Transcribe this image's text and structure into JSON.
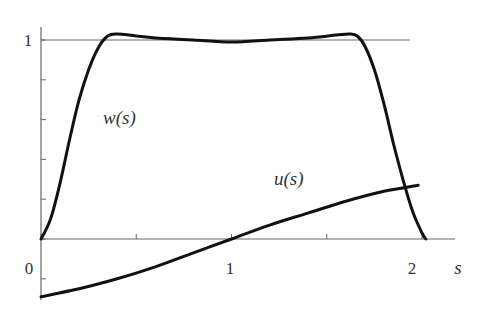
{
  "chart_data": {
    "type": "line",
    "title": "",
    "xlabel": "s",
    "ylabel": "",
    "xlim": [
      0,
      2.2
    ],
    "ylim": [
      -0.32,
      1.08
    ],
    "grid": false,
    "legend": "none (inline curve labels)",
    "x_ticks": [
      0,
      0.5,
      1,
      1.5,
      2
    ],
    "x_tick_labels": [
      "0",
      "1",
      "2"
    ],
    "y_ticks": [
      -0.2,
      0,
      0.2,
      0.4,
      0.6,
      0.8,
      1
    ],
    "y_tick_labels": [
      "1"
    ],
    "reference_lines": [
      {
        "y": 1,
        "x_range": [
          0,
          2.0
        ]
      }
    ],
    "series": [
      {
        "name": "w(s)",
        "x": [
          0,
          0.05,
          0.1,
          0.15,
          0.2,
          0.25,
          0.3,
          0.35,
          0.4,
          0.5,
          0.6,
          0.8,
          1.0,
          1.2,
          1.4,
          1.55,
          1.62,
          1.66,
          1.7,
          1.75,
          1.8,
          1.85,
          1.9,
          1.95,
          2.0,
          2.02
        ],
        "values": [
          0,
          0.1,
          0.28,
          0.5,
          0.7,
          0.85,
          0.96,
          1.02,
          1.03,
          1.02,
          1.01,
          1.0,
          0.99,
          1.0,
          1.01,
          1.025,
          1.03,
          1.02,
          0.97,
          0.85,
          0.68,
          0.48,
          0.3,
          0.14,
          0.03,
          0
        ]
      },
      {
        "name": "u(s)",
        "x": [
          0,
          0.2,
          0.4,
          0.6,
          0.8,
          1.0,
          1.2,
          1.4,
          1.6,
          1.8,
          1.98
        ],
        "values": [
          -0.29,
          -0.25,
          -0.2,
          -0.14,
          -0.07,
          0.0,
          0.07,
          0.13,
          0.19,
          0.24,
          0.27
        ]
      }
    ],
    "annotations": [
      {
        "text": "w(s)",
        "x": 0.45,
        "y": 0.48
      },
      {
        "text": "u(s)",
        "x": 1.32,
        "y": 0.3
      }
    ]
  },
  "labels": {
    "x_origin": "0",
    "x_one": "1",
    "x_two": "2",
    "x_axis_name": "s",
    "y_one": "1",
    "w_label": "w(s)",
    "u_label": "u(s)"
  }
}
